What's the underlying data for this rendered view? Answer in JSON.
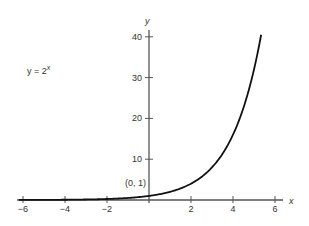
{
  "chart_data": {
    "type": "line",
    "title": "",
    "equation_label": "y = 2",
    "equation_exponent": "x",
    "xlabel": "x",
    "ylabel": "y",
    "xlim": [
      -6.3,
      6.4
    ],
    "ylim": [
      0,
      41
    ],
    "x_ticks": [
      -6,
      -4,
      -2,
      2,
      4,
      6
    ],
    "x_tick_labels": [
      "−6",
      "−4",
      "−2",
      "2",
      "4",
      "6"
    ],
    "y_ticks": [
      10,
      20,
      30,
      40
    ],
    "y_tick_labels": [
      "10",
      "20",
      "30",
      "40"
    ],
    "grid": false,
    "legend": null,
    "annotations": [
      {
        "text": "(0, 1)",
        "x": 0,
        "y": 1
      }
    ],
    "series": [
      {
        "name": "y = 2^x",
        "function": "2^x",
        "x": [
          -6,
          -5,
          -4,
          -3,
          -2,
          -1,
          0,
          1,
          2,
          3,
          4,
          5,
          5.33
        ],
        "values": [
          0.016,
          0.031,
          0.063,
          0.125,
          0.25,
          0.5,
          1,
          2,
          4,
          8,
          16,
          32,
          40.2
        ]
      }
    ],
    "colors": {
      "axis": "#555555",
      "curve": "#111111",
      "text": "#333333"
    }
  }
}
